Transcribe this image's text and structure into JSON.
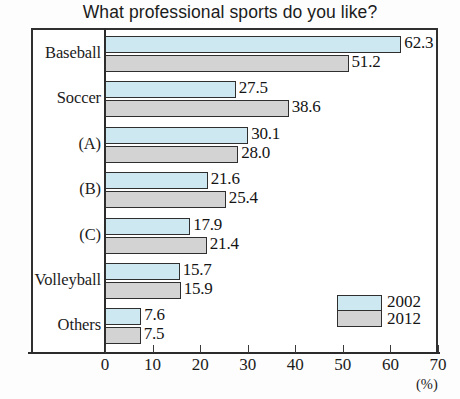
{
  "chart_data": {
    "type": "bar",
    "orientation": "horizontal",
    "title": "What professional sports do you like?",
    "xlabel": "(%)",
    "ylabel": "",
    "xlim": [
      0,
      70
    ],
    "xticks": [
      0,
      10,
      20,
      30,
      40,
      50,
      60,
      70
    ],
    "xtick_labels": [
      "0",
      "10",
      "20",
      "30",
      "40",
      "50",
      "60",
      "70"
    ],
    "grid": false,
    "legend_position": "bottom-right",
    "categories": [
      "Baseball",
      "Soccer",
      "(A)",
      "(B)",
      "(C)",
      "Volleyball",
      "Others"
    ],
    "series": [
      {
        "name": "2002",
        "color": "#cde8f1",
        "values": [
          62.3,
          27.5,
          30.1,
          21.6,
          17.9,
          15.7,
          7.6
        ],
        "value_labels": [
          "62.3",
          "27.5",
          "30.1",
          "21.6",
          "17.9",
          "15.7",
          "7.6"
        ]
      },
      {
        "name": "2012",
        "color": "#d3d3d3",
        "values": [
          51.2,
          38.6,
          28.0,
          25.4,
          21.4,
          15.9,
          7.5
        ],
        "value_labels": [
          "51.2",
          "38.6",
          "28.0",
          "25.4",
          "21.4",
          "15.9",
          "7.5"
        ]
      }
    ]
  },
  "legend": {
    "entries": [
      {
        "label": "2002",
        "color": "#cde8f1"
      },
      {
        "label": "2012",
        "color": "#d3d3d3"
      }
    ]
  },
  "axis": {
    "unit": "(%)"
  },
  "style": {
    "frame_color": "#303030",
    "text_color": "#1b1b1b"
  }
}
